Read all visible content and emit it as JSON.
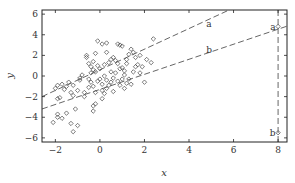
{
  "chart_data": {
    "type": "scatter",
    "title": "",
    "xlabel": "x",
    "ylabel": "y",
    "xlim": [
      -2.6,
      8.4
    ],
    "ylim": [
      -6.4,
      6.4
    ],
    "xticks": [
      -2,
      0,
      2,
      4,
      6,
      8
    ],
    "yticks": [
      -6,
      -4,
      -2,
      0,
      2,
      4,
      6
    ],
    "grid": false,
    "legend": null,
    "marker": "diamond-open",
    "colors": {
      "points": "#444444",
      "lines": "#555555",
      "axes": "#222222"
    },
    "series": [
      {
        "name": "observations",
        "points": [
          [
            -2.1,
            -4.5
          ],
          [
            -1.9,
            -3.7
          ],
          [
            -1.9,
            -4.0
          ],
          [
            -1.7,
            -4.1
          ],
          [
            -1.5,
            -3.6
          ],
          [
            -1.3,
            -4.6
          ],
          [
            -1.2,
            -5.4
          ],
          [
            -1.0,
            -4.8
          ],
          [
            -1.1,
            -3.2
          ],
          [
            -0.3,
            -3.4
          ],
          [
            -0.3,
            -2.9
          ],
          [
            -0.2,
            -2.7
          ],
          [
            0.1,
            -2.2
          ],
          [
            -1.9,
            -2.2
          ],
          [
            -1.8,
            -2.1
          ],
          [
            -1.5,
            -1.0
          ],
          [
            -1.7,
            -0.8
          ],
          [
            -1.9,
            -0.9
          ],
          [
            -2.0,
            -1.2
          ],
          [
            -1.6,
            -1.3
          ],
          [
            -1.2,
            -0.9
          ],
          [
            -1.2,
            -1.9
          ],
          [
            -0.9,
            -0.2
          ],
          [
            -0.7,
            -2.0
          ],
          [
            -0.5,
            -0.3
          ],
          [
            -0.5,
            -1.1
          ],
          [
            -0.4,
            -0.6
          ],
          [
            -0.3,
            -1.0
          ],
          [
            -0.2,
            0.4
          ],
          [
            -0.1,
            -0.5
          ],
          [
            0.0,
            -0.3
          ],
          [
            0.1,
            -0.8
          ],
          [
            0.1,
            -1.4
          ],
          [
            0.2,
            0.0
          ],
          [
            0.3,
            -0.4
          ],
          [
            0.3,
            -1.2
          ],
          [
            0.4,
            -0.9
          ],
          [
            0.5,
            -0.6
          ],
          [
            0.6,
            -0.2
          ],
          [
            0.7,
            0.3
          ],
          [
            0.8,
            -0.5
          ],
          [
            0.9,
            -0.9
          ],
          [
            1.0,
            -0.3
          ],
          [
            1.1,
            0.1
          ],
          [
            1.2,
            -0.7
          ],
          [
            1.3,
            -0.3
          ],
          [
            1.4,
            -0.8
          ],
          [
            -0.6,
            2.0
          ],
          [
            -0.6,
            1.8
          ],
          [
            -0.5,
            1.2
          ],
          [
            -0.4,
            0.9
          ],
          [
            -0.4,
            0.3
          ],
          [
            -0.3,
            0.6
          ],
          [
            -0.2,
            2.2
          ],
          [
            -0.1,
            3.4
          ],
          [
            0.1,
            3.1
          ],
          [
            0.3,
            3.2
          ],
          [
            0.8,
            3.1
          ],
          [
            0.9,
            3.0
          ],
          [
            1.0,
            2.9
          ],
          [
            0.2,
            1.1
          ],
          [
            0.4,
            1.3
          ],
          [
            0.5,
            1.6
          ],
          [
            0.6,
            1.8
          ],
          [
            0.7,
            1.5
          ],
          [
            0.8,
            1.2
          ],
          [
            1.0,
            0.8
          ],
          [
            1.1,
            0.5
          ],
          [
            1.2,
            1.6
          ],
          [
            1.3,
            2.1
          ],
          [
            1.4,
            2.6
          ],
          [
            1.5,
            2.3
          ],
          [
            1.6,
            1.8
          ],
          [
            1.7,
            1.1
          ],
          [
            1.8,
            2.0
          ],
          [
            1.9,
            0.9
          ],
          [
            2.0,
            -0.6
          ],
          [
            2.1,
            1.6
          ],
          [
            1.5,
            0.4
          ],
          [
            1.6,
            0.9
          ],
          [
            -0.8,
            0.1
          ],
          [
            -0.9,
            -0.4
          ],
          [
            -1.0,
            -1.4
          ],
          [
            -1.3,
            -1.6
          ],
          [
            -1.4,
            -0.6
          ],
          [
            0.0,
            0.7
          ],
          [
            -0.1,
            1.0
          ],
          [
            0.5,
            0.4
          ],
          [
            0.9,
            0.7
          ],
          [
            1.2,
            1.2
          ],
          [
            2.3,
            1.3
          ],
          [
            2.4,
            3.6
          ],
          [
            0.2,
            -1.7
          ],
          [
            -0.2,
            -1.6
          ],
          [
            0.6,
            -1.5
          ],
          [
            1.1,
            -1.2
          ],
          [
            -0.7,
            -1.6
          ],
          [
            1.8,
            0.3
          ],
          [
            0.3,
            2.3
          ],
          [
            -0.3,
            1.4
          ]
        ]
      },
      {
        "name": "outliers",
        "points": [
          {
            "x": 8.0,
            "y": 4.8,
            "label": "a"
          },
          {
            "x": 8.0,
            "y": -5.5,
            "label": "b"
          }
        ]
      }
    ],
    "lines": [
      {
        "name": "a",
        "style": "dashed",
        "slope": 1.0,
        "intercept": 0.6,
        "label": "a",
        "label_pos": [
          4.9,
          5.0
        ]
      },
      {
        "name": "b",
        "style": "dashed",
        "slope": 0.73,
        "intercept": -1.3,
        "label": "b",
        "label_pos": [
          4.9,
          2.5
        ]
      },
      {
        "name": "vertical-x8",
        "style": "dashed",
        "x": 8.0
      }
    ]
  }
}
